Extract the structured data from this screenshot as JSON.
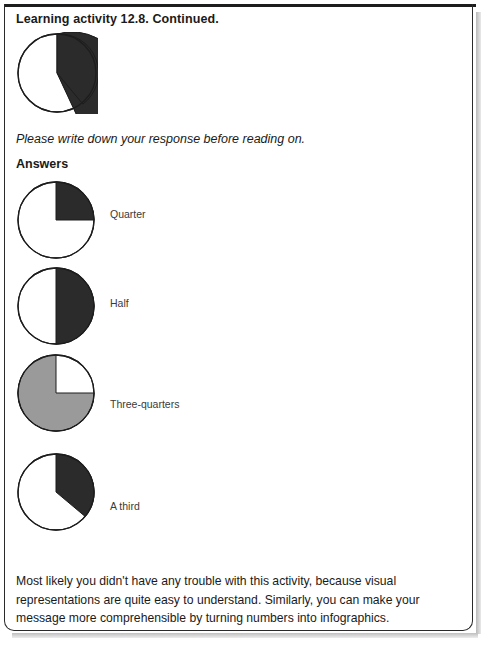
{
  "page": {
    "title": "Learning activity 12.8. Continued.",
    "prompt": "Please write down your response before reading on.",
    "answers_heading": "Answers",
    "closing_paragraph": "Most likely you didn't have any trouble with this activity, because visual representations are quite easy to understand. Similarly, you can make your message more comprehensible by turning numbers into infographics."
  },
  "colors": {
    "black_wedge": "#2b2b2b",
    "gray_wedge": "#9a9a9a",
    "outline": "#1d1d1d",
    "rule": "#1d1d1d",
    "text": "#1a1a1a",
    "label_text": "#3a3a3a",
    "page_background": "#ffffff"
  },
  "chart_data": [
    {
      "type": "pie",
      "name": "question-pie",
      "title": "",
      "labels": [
        "shaded",
        "unshaded"
      ],
      "values": [
        36,
        64
      ],
      "colors": [
        "#2b2b2b",
        "#ffffff"
      ],
      "start_angle_deg": 0,
      "sweep_deg": 130,
      "label": "",
      "legend": "none"
    },
    {
      "type": "pie",
      "name": "answer-pie-quarter",
      "title": "",
      "labels": [
        "shaded",
        "unshaded"
      ],
      "values": [
        25,
        75
      ],
      "colors": [
        "#2b2b2b",
        "#ffffff"
      ],
      "start_angle_deg": 0,
      "sweep_deg": 90,
      "label": "Quarter",
      "legend": "none"
    },
    {
      "type": "pie",
      "name": "answer-pie-half",
      "title": "",
      "labels": [
        "shaded",
        "unshaded"
      ],
      "values": [
        50,
        50
      ],
      "colors": [
        "#2b2b2b",
        "#ffffff"
      ],
      "start_angle_deg": 0,
      "sweep_deg": 180,
      "label": "Half",
      "legend": "none"
    },
    {
      "type": "pie",
      "name": "answer-pie-three-quarters",
      "title": "",
      "labels": [
        "shaded",
        "unshaded"
      ],
      "values": [
        75,
        25
      ],
      "colors": [
        "#9a9a9a",
        "#ffffff"
      ],
      "start_angle_deg": 90,
      "sweep_deg": 270,
      "label": "Three-quarters",
      "legend": "none"
    },
    {
      "type": "pie",
      "name": "answer-pie-a-third",
      "title": "",
      "labels": [
        "shaded",
        "unshaded"
      ],
      "values": [
        36,
        64
      ],
      "colors": [
        "#2b2b2b",
        "#ffffff"
      ],
      "start_angle_deg": 0,
      "sweep_deg": 130,
      "label": "A third",
      "legend": "none"
    }
  ],
  "pie_labels": {
    "quarter": "Quarter",
    "half": "Half",
    "three_quarters": "Three-quarters",
    "a_third": "A third"
  }
}
